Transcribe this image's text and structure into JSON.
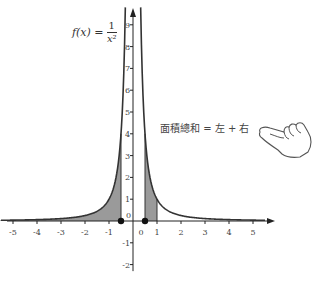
{
  "formula": {
    "lhs": "f(x) =",
    "numerator": "1",
    "denominator": "x²"
  },
  "annotation": "面積總和 = 左 + 右",
  "icons": {
    "hand": "pointing-hand-icon"
  },
  "chart_data": {
    "type": "line",
    "title": "",
    "function": "f(x) = 1/x^2",
    "xlim": [
      -5.5,
      5.5
    ],
    "ylim": [
      -2.3,
      9.8
    ],
    "x_ticks": [
      -5,
      -4,
      -3,
      -2,
      -1,
      0,
      1,
      2,
      3,
      4,
      5
    ],
    "y_ticks": [
      -2,
      -1,
      0,
      1,
      2,
      3,
      4,
      5,
      6,
      7,
      8,
      9
    ],
    "shaded_regions": [
      {
        "from": -5.5,
        "to": -0.5,
        "label": "left"
      },
      {
        "from": 0.5,
        "to": 1,
        "label": "right"
      }
    ],
    "marked_points": [
      {
        "x": -0.5,
        "y": 0
      },
      {
        "x": 0.5,
        "y": 0
      }
    ],
    "asymptote": {
      "x": 0
    },
    "grid": false,
    "line_color": "#333333",
    "fill_color": "#9a9a9a"
  }
}
